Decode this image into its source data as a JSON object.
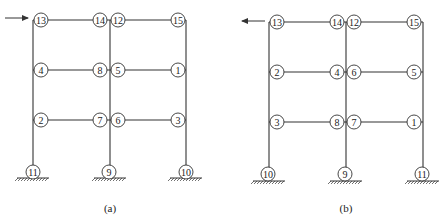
{
  "figures": [
    {
      "id": "a",
      "caption": "(a)",
      "load_arrow": {
        "direction": "right",
        "x1": 5,
        "x2": 28,
        "y": 18
      },
      "columns_x": [
        33,
        110,
        186
      ],
      "levels_y": [
        20,
        70,
        120
      ],
      "support_y": 174,
      "nodes": [
        {
          "label": "13",
          "x": 41,
          "y": 20
        },
        {
          "label": "14",
          "x": 100,
          "y": 20
        },
        {
          "label": "12",
          "x": 118,
          "y": 20
        },
        {
          "label": "15",
          "x": 178,
          "y": 20
        },
        {
          "label": "4",
          "x": 41,
          "y": 70
        },
        {
          "label": "8",
          "x": 100,
          "y": 70
        },
        {
          "label": "5",
          "x": 118,
          "y": 70
        },
        {
          "label": "1",
          "x": 178,
          "y": 70
        },
        {
          "label": "2",
          "x": 41,
          "y": 120
        },
        {
          "label": "7",
          "x": 100,
          "y": 120
        },
        {
          "label": "6",
          "x": 118,
          "y": 120
        },
        {
          "label": "3",
          "x": 178,
          "y": 120
        },
        {
          "label": "11",
          "x": 33,
          "y": 172
        },
        {
          "label": "9",
          "x": 109,
          "y": 172
        },
        {
          "label": "10",
          "x": 186,
          "y": 172
        }
      ]
    },
    {
      "id": "b",
      "caption": "(b)",
      "load_arrow": {
        "direction": "left",
        "x1": 265,
        "x2": 242,
        "y": 21
      },
      "columns_x": [
        269,
        346,
        423
      ],
      "levels_y": [
        22,
        72,
        122
      ],
      "support_y": 177,
      "nodes": [
        {
          "label": "13",
          "x": 277,
          "y": 22
        },
        {
          "label": "14",
          "x": 337,
          "y": 22
        },
        {
          "label": "12",
          "x": 354,
          "y": 22
        },
        {
          "label": "15",
          "x": 414,
          "y": 22
        },
        {
          "label": "2",
          "x": 277,
          "y": 72
        },
        {
          "label": "4",
          "x": 337,
          "y": 72
        },
        {
          "label": "6",
          "x": 354,
          "y": 72
        },
        {
          "label": "5",
          "x": 414,
          "y": 72
        },
        {
          "label": "3",
          "x": 277,
          "y": 122
        },
        {
          "label": "8",
          "x": 337,
          "y": 122
        },
        {
          "label": "7",
          "x": 354,
          "y": 122
        },
        {
          "label": "1",
          "x": 414,
          "y": 122
        },
        {
          "label": "10",
          "x": 268,
          "y": 174
        },
        {
          "label": "9",
          "x": 345,
          "y": 174
        },
        {
          "label": "11",
          "x": 422,
          "y": 174
        }
      ]
    }
  ]
}
